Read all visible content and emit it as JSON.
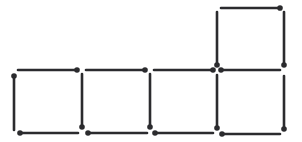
{
  "diagram": {
    "stick_color": "#2b2b2e",
    "background": "#ffffff",
    "matchsticks": [
      {
        "id": "top-1",
        "x1": 18,
        "y1": 70,
        "x2": 77,
        "y2": 70,
        "head": "end"
      },
      {
        "id": "top-2",
        "x1": 86,
        "y1": 70,
        "x2": 145,
        "y2": 70,
        "head": "end"
      },
      {
        "id": "top-3",
        "x1": 154,
        "y1": 70,
        "x2": 213,
        "y2": 70,
        "head": "end"
      },
      {
        "id": "top-4",
        "x1": 221,
        "y1": 70,
        "x2": 280,
        "y2": 70,
        "head": "start"
      },
      {
        "id": "upper-top",
        "x1": 221,
        "y1": 8,
        "x2": 280,
        "y2": 8,
        "head": "end"
      },
      {
        "id": "bottom-1",
        "x1": 20,
        "y1": 133,
        "x2": 78,
        "y2": 133,
        "head": "start"
      },
      {
        "id": "bottom-2",
        "x1": 88,
        "y1": 133,
        "x2": 147,
        "y2": 133,
        "head": "start"
      },
      {
        "id": "bottom-3",
        "x1": 155,
        "y1": 133,
        "x2": 213,
        "y2": 133,
        "head": "start"
      },
      {
        "id": "bottom-4",
        "x1": 222,
        "y1": 134,
        "x2": 280,
        "y2": 134,
        "head": "start"
      },
      {
        "id": "left-1",
        "x1": 14,
        "y1": 76,
        "x2": 14,
        "y2": 130,
        "head": "start"
      },
      {
        "id": "vert-2",
        "x1": 82,
        "y1": 74,
        "x2": 82,
        "y2": 127,
        "head": "end"
      },
      {
        "id": "vert-3",
        "x1": 150,
        "y1": 74,
        "x2": 150,
        "y2": 127,
        "head": "end"
      },
      {
        "id": "vert-4",
        "x1": 217,
        "y1": 75,
        "x2": 217,
        "y2": 128,
        "head": "end"
      },
      {
        "id": "vert-5",
        "x1": 284,
        "y1": 76,
        "x2": 284,
        "y2": 129,
        "head": "end"
      },
      {
        "id": "upper-left",
        "x1": 217,
        "y1": 12,
        "x2": 217,
        "y2": 65,
        "head": "end"
      },
      {
        "id": "upper-right",
        "x1": 284,
        "y1": 12,
        "x2": 284,
        "y2": 65,
        "head": "end"
      }
    ]
  }
}
